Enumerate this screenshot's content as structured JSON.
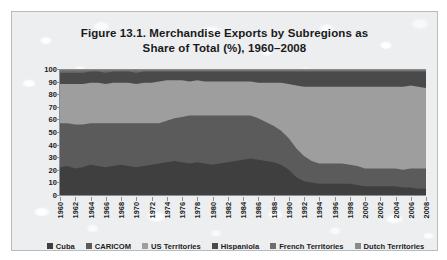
{
  "figure": {
    "title_line1": "Figure 13.1. Merchandise Exports by Subregions as",
    "title_line2": "Share of Total (%), 1960–2008"
  },
  "axes": {
    "y_ticks": [
      "100",
      "90",
      "80",
      "70",
      "60",
      "50",
      "40",
      "30",
      "20",
      "10",
      "0"
    ],
    "x_ticks": [
      "1960",
      "1962",
      "1964",
      "1966",
      "1968",
      "1970",
      "1972",
      "1974",
      "1976",
      "1978",
      "1980",
      "1982",
      "1984",
      "1986",
      "1988",
      "1990",
      "1992",
      "1994",
      "1996",
      "1998",
      "2000",
      "2002",
      "2004",
      "2006",
      "2008"
    ]
  },
  "legend": {
    "items": [
      {
        "label": "Cuba",
        "color": "#3f3f3f"
      },
      {
        "label": "CARICOM",
        "color": "#5b5b5b"
      },
      {
        "label": "US Territories",
        "color": "#9e9e9e"
      },
      {
        "label": "Hispaniola",
        "color": "#4a4a4a"
      },
      {
        "label": "French Territories",
        "color": "#6e6e6e"
      },
      {
        "label": "Dutch Territories",
        "color": "#8a8a8a"
      }
    ]
  },
  "chart_data": {
    "type": "area",
    "title": "Figure 13.1. Merchandise Exports by Subregions as Share of Total (%), 1960–2008",
    "xlabel": "",
    "ylabel": "",
    "ylim": [
      0,
      100
    ],
    "xlim": [
      1960,
      2008
    ],
    "grid": false,
    "stacked": true,
    "legend_position": "bottom",
    "x": [
      1960,
      1961,
      1962,
      1963,
      1964,
      1965,
      1966,
      1967,
      1968,
      1969,
      1970,
      1971,
      1972,
      1973,
      1974,
      1975,
      1976,
      1977,
      1978,
      1979,
      1980,
      1981,
      1982,
      1983,
      1984,
      1985,
      1986,
      1987,
      1988,
      1989,
      1990,
      1991,
      1992,
      1993,
      1994,
      1995,
      1996,
      1997,
      1998,
      1999,
      2000,
      2001,
      2002,
      2003,
      2004,
      2005,
      2006,
      2007,
      2008
    ],
    "series": [
      {
        "name": "Cuba",
        "color": "#3f3f3f",
        "values": [
          22,
          23,
          21,
          22,
          24,
          23,
          22,
          23,
          24,
          23,
          22,
          23,
          24,
          25,
          26,
          27,
          26,
          25,
          26,
          25,
          24,
          25,
          26,
          27,
          28,
          29,
          28,
          27,
          26,
          24,
          20,
          14,
          11,
          10,
          9,
          9,
          9,
          9,
          9,
          8,
          7,
          7,
          7,
          7,
          7,
          6,
          6,
          5,
          5
        ]
      },
      {
        "name": "CARICOM",
        "color": "#5b5b5b",
        "values": [
          35,
          34,
          35,
          34,
          33,
          34,
          35,
          34,
          33,
          34,
          35,
          34,
          33,
          32,
          33,
          34,
          36,
          38,
          37,
          38,
          39,
          38,
          37,
          36,
          35,
          34,
          33,
          31,
          29,
          27,
          25,
          23,
          20,
          17,
          16,
          16,
          16,
          16,
          15,
          15,
          14,
          14,
          14,
          14,
          14,
          14,
          15,
          16,
          16
        ]
      },
      {
        "name": "US Territories",
        "color": "#9e9e9e",
        "values": [
          31,
          31,
          32,
          32,
          32,
          32,
          31,
          32,
          32,
          32,
          31,
          32,
          32,
          33,
          32,
          30,
          29,
          27,
          28,
          27,
          27,
          27,
          27,
          27,
          27,
          27,
          28,
          31,
          34,
          38,
          43,
          50,
          55,
          59,
          61,
          61,
          61,
          61,
          62,
          63,
          65,
          65,
          65,
          65,
          65,
          66,
          66,
          65,
          64
        ]
      },
      {
        "name": "Hispaniola",
        "color": "#4a4a4a",
        "values": [
          9,
          9,
          9,
          9,
          9,
          9,
          9,
          9,
          9,
          9,
          9,
          9,
          9,
          8,
          7,
          7,
          7,
          8,
          7,
          8,
          8,
          8,
          8,
          8,
          8,
          8,
          9,
          9,
          9,
          9,
          10,
          11,
          12,
          12,
          12,
          12,
          12,
          12,
          12,
          12,
          12,
          12,
          12,
          12,
          12,
          12,
          11,
          12,
          13
        ]
      },
      {
        "name": "French Territories",
        "color": "#6e6e6e",
        "values": [
          2,
          2,
          2,
          2,
          1,
          1,
          2,
          1,
          1,
          1,
          2,
          1,
          1,
          1,
          1,
          1,
          1,
          1,
          1,
          1,
          1,
          1,
          1,
          1,
          1,
          1,
          1,
          1,
          1,
          1,
          1,
          1,
          1,
          1,
          1,
          1,
          1,
          1,
          1,
          1,
          1,
          1,
          1,
          1,
          1,
          1,
          1,
          1,
          1
        ]
      },
      {
        "name": "Dutch Territories",
        "color": "#8a8a8a",
        "values": [
          1,
          1,
          1,
          1,
          1,
          1,
          1,
          1,
          1,
          1,
          1,
          1,
          1,
          1,
          1,
          1,
          1,
          1,
          1,
          1,
          1,
          1,
          1,
          1,
          1,
          1,
          1,
          1,
          1,
          1,
          1,
          1,
          1,
          1,
          1,
          1,
          1,
          1,
          1,
          1,
          1,
          1,
          1,
          1,
          1,
          1,
          1,
          1,
          1
        ]
      }
    ]
  }
}
